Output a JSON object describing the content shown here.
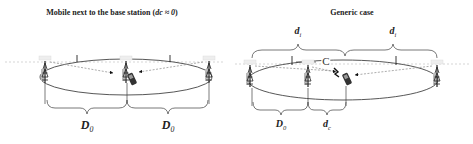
{
  "left_panel": {
    "title_prefix": "Mobile next to the base station (",
    "title_var": "dc ≈ 0",
    "title_suffix": ")",
    "labels": {
      "d0_left": "D",
      "d0_left_sub": "0",
      "d0_right": "D",
      "d0_right_sub": "0"
    },
    "icons": [
      "base-station-tower",
      "base-station-tower",
      "base-station-tower",
      "mobile-phone"
    ]
  },
  "right_panel": {
    "title": "Generic case",
    "labels": {
      "di_left": "d",
      "di_left_sub": "i",
      "di_right": "d",
      "di_right_sub": "i",
      "cell_center": "C",
      "d0": "D",
      "d0_sub": "0",
      "dc": "d",
      "dc_sub": "c"
    },
    "icons": [
      "base-station-tower",
      "base-station-tower",
      "base-station-tower",
      "mobile-phone"
    ]
  }
}
